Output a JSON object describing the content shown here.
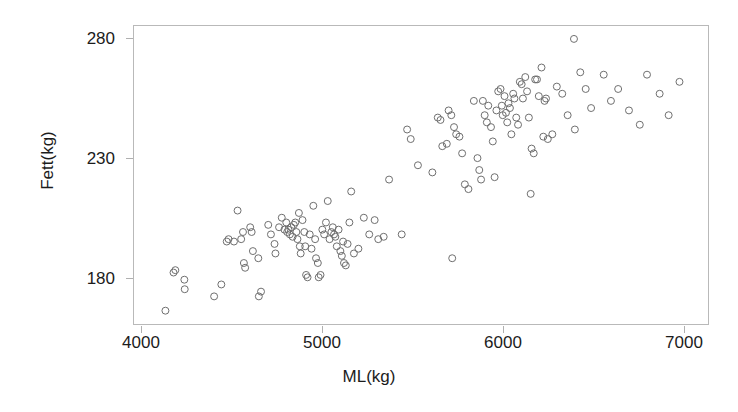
{
  "chart_data": {
    "type": "scatter",
    "title": "",
    "xlabel": "ML(kg)",
    "ylabel": "Fett(kg)",
    "xlim": [
      3900,
      7100
    ],
    "ylim": [
      160,
      284
    ],
    "xticks": [
      4000,
      5000,
      6000,
      7000
    ],
    "xtick_labels": [
      "4000",
      "5000",
      "6000",
      "7000"
    ],
    "yticks": [
      180,
      230,
      280
    ],
    "ytick_labels": [
      "180",
      "230",
      "280"
    ],
    "grid": false,
    "legend": null,
    "marker": {
      "shape": "open-circle",
      "size_px": 7,
      "stroke": "#6e6e6e",
      "fill": "none"
    },
    "frame_color": "#b9b9b9",
    "points": [
      [
        4130,
        166
      ],
      [
        4175,
        182
      ],
      [
        4185,
        183
      ],
      [
        4235,
        179
      ],
      [
        4237,
        175
      ],
      [
        4400,
        172
      ],
      [
        4440,
        177
      ],
      [
        4470,
        195
      ],
      [
        4480,
        196
      ],
      [
        4510,
        195
      ],
      [
        4530,
        208
      ],
      [
        4550,
        196
      ],
      [
        4560,
        199
      ],
      [
        4565,
        186
      ],
      [
        4572,
        184
      ],
      [
        4600,
        201
      ],
      [
        4608,
        199
      ],
      [
        4615,
        191
      ],
      [
        4645,
        188
      ],
      [
        4648,
        172
      ],
      [
        4660,
        174
      ],
      [
        4700,
        202
      ],
      [
        4715,
        198
      ],
      [
        4735,
        194
      ],
      [
        4740,
        190
      ],
      [
        4760,
        201
      ],
      [
        4775,
        205
      ],
      [
        4790,
        200
      ],
      [
        4800,
        203
      ],
      [
        4805,
        199
      ],
      [
        4812,
        200
      ],
      [
        4820,
        198
      ],
      [
        4828,
        201
      ],
      [
        4835,
        197
      ],
      [
        4842,
        202
      ],
      [
        4850,
        203
      ],
      [
        4856,
        199
      ],
      [
        4862,
        196
      ],
      [
        4870,
        207
      ],
      [
        4875,
        193
      ],
      [
        4880,
        190
      ],
      [
        4890,
        204
      ],
      [
        4900,
        199
      ],
      [
        4905,
        193
      ],
      [
        4910,
        181
      ],
      [
        4918,
        180
      ],
      [
        4930,
        198
      ],
      [
        4940,
        192
      ],
      [
        4950,
        210
      ],
      [
        4960,
        196
      ],
      [
        4965,
        188
      ],
      [
        4975,
        186
      ],
      [
        4980,
        180
      ],
      [
        4990,
        181
      ],
      [
        5000,
        200
      ],
      [
        5010,
        198
      ],
      [
        5020,
        203
      ],
      [
        5030,
        212
      ],
      [
        5040,
        196
      ],
      [
        5050,
        199
      ],
      [
        5058,
        201
      ],
      [
        5065,
        198
      ],
      [
        5072,
        197
      ],
      [
        5080,
        193
      ],
      [
        5090,
        200
      ],
      [
        5100,
        191
      ],
      [
        5108,
        189
      ],
      [
        5115,
        195
      ],
      [
        5120,
        186
      ],
      [
        5130,
        185
      ],
      [
        5140,
        194
      ],
      [
        5150,
        203
      ],
      [
        5160,
        216
      ],
      [
        5175,
        190
      ],
      [
        5200,
        192
      ],
      [
        5230,
        205
      ],
      [
        5260,
        198
      ],
      [
        5290,
        204
      ],
      [
        5310,
        196
      ],
      [
        5340,
        197
      ],
      [
        5370,
        221
      ],
      [
        5440,
        198
      ],
      [
        5470,
        242
      ],
      [
        5490,
        238
      ],
      [
        5530,
        227
      ],
      [
        5610,
        224
      ],
      [
        5640,
        247
      ],
      [
        5655,
        246
      ],
      [
        5665,
        235
      ],
      [
        5690,
        236
      ],
      [
        5700,
        250
      ],
      [
        5715,
        248
      ],
      [
        5720,
        188
      ],
      [
        5730,
        243
      ],
      [
        5742,
        240
      ],
      [
        5760,
        239
      ],
      [
        5775,
        232
      ],
      [
        5790,
        219
      ],
      [
        5810,
        217
      ],
      [
        5840,
        254
      ],
      [
        5860,
        230
      ],
      [
        5870,
        225
      ],
      [
        5880,
        221
      ],
      [
        5890,
        254
      ],
      [
        5900,
        248
      ],
      [
        5912,
        245
      ],
      [
        5920,
        252
      ],
      [
        5935,
        243
      ],
      [
        5945,
        237
      ],
      [
        5955,
        222
      ],
      [
        5965,
        250
      ],
      [
        5975,
        258
      ],
      [
        5988,
        259
      ],
      [
        5995,
        252
      ],
      [
        6000,
        248
      ],
      [
        6010,
        256
      ],
      [
        6018,
        249
      ],
      [
        6025,
        245
      ],
      [
        6032,
        253
      ],
      [
        6040,
        251
      ],
      [
        6048,
        240
      ],
      [
        6058,
        257
      ],
      [
        6065,
        255
      ],
      [
        6075,
        247
      ],
      [
        6085,
        244
      ],
      [
        6095,
        262
      ],
      [
        6105,
        261
      ],
      [
        6112,
        255
      ],
      [
        6125,
        264
      ],
      [
        6135,
        258
      ],
      [
        6145,
        247
      ],
      [
        6155,
        215
      ],
      [
        6160,
        234
      ],
      [
        6172,
        232
      ],
      [
        6180,
        263
      ],
      [
        6190,
        263
      ],
      [
        6200,
        256
      ],
      [
        6215,
        268
      ],
      [
        6225,
        239
      ],
      [
        6232,
        254
      ],
      [
        6240,
        255
      ],
      [
        6250,
        238
      ],
      [
        6275,
        240
      ],
      [
        6300,
        260
      ],
      [
        6330,
        257
      ],
      [
        6360,
        248
      ],
      [
        6395,
        280
      ],
      [
        6400,
        242
      ],
      [
        6430,
        266
      ],
      [
        6460,
        259
      ],
      [
        6490,
        251
      ],
      [
        6560,
        265
      ],
      [
        6600,
        254
      ],
      [
        6640,
        259
      ],
      [
        6700,
        250
      ],
      [
        6760,
        244
      ],
      [
        6800,
        265
      ],
      [
        6870,
        257
      ],
      [
        6920,
        248
      ],
      [
        6980,
        262
      ]
    ]
  },
  "axis": {
    "ylabel_text": "Fett(kg)",
    "xlabel_text": "ML(kg)"
  }
}
